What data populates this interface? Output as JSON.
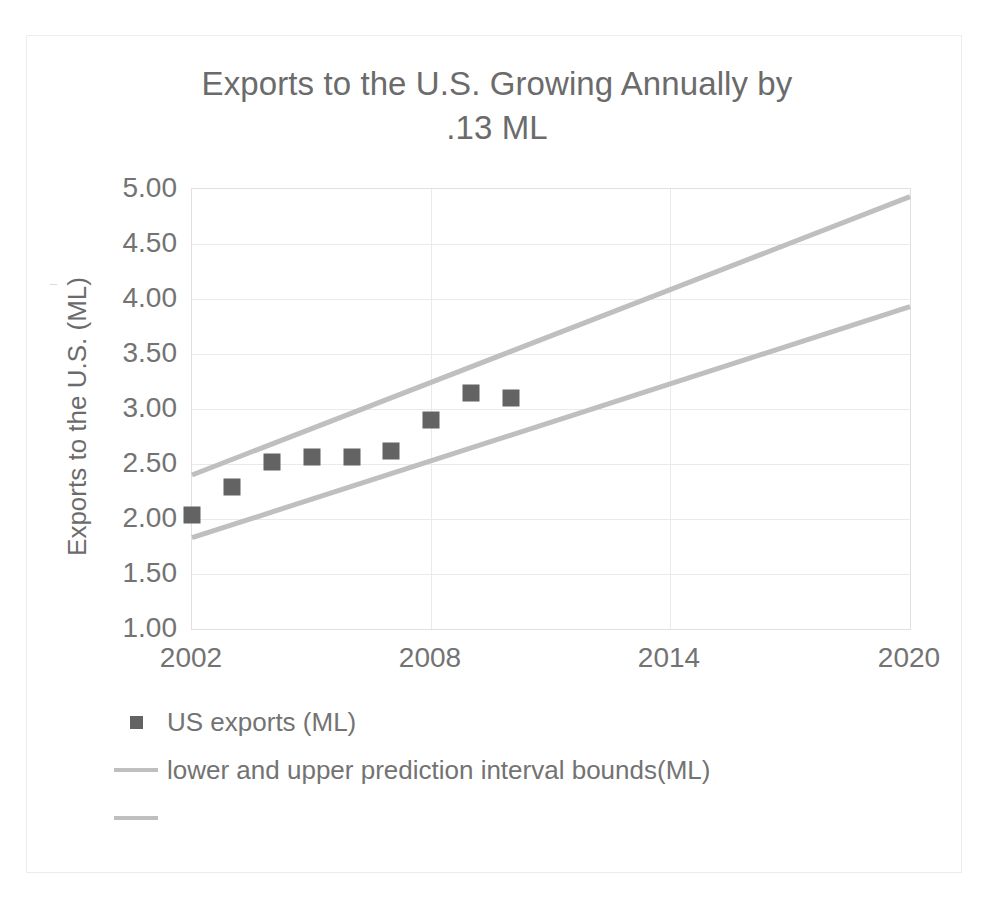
{
  "chart_data": {
    "type": "scatter",
    "title": "Exports to the U.S. Growing Annually by .13 ML",
    "title_line1": "Exports to the U.S. Growing Annually by",
    "title_line2": ".13 ML",
    "xlabel": "",
    "ylabel": "Exports to the U.S. (ML)",
    "xlim": [
      2002,
      2020
    ],
    "ylim": [
      1.0,
      5.0
    ],
    "xticks": [
      "2002",
      "2008",
      "2014",
      "2020"
    ],
    "xtick_values": [
      2002,
      2008,
      2014,
      2020
    ],
    "yticks": [
      "1.00",
      "1.50",
      "2.00",
      "2.50",
      "3.00",
      "3.50",
      "4.00",
      "4.50",
      "5.00"
    ],
    "ytick_values": [
      1.0,
      1.5,
      2.0,
      2.5,
      3.0,
      3.5,
      4.0,
      4.5,
      5.0
    ],
    "grid": "horizontal",
    "legend_position": "bottom-left",
    "series": [
      {
        "name": "US exports (ML)",
        "type": "scatter",
        "marker": "square",
        "color": "#636363",
        "x": [
          2002,
          2003,
          2004,
          2005,
          2006,
          2007,
          2008,
          2009,
          2010
        ],
        "values": [
          2.04,
          2.29,
          2.52,
          2.56,
          2.56,
          2.62,
          2.9,
          3.15,
          3.1
        ]
      },
      {
        "name": "lower and upper prediction interval bounds(ML)",
        "type": "line",
        "color": "#bfbfbf",
        "x": [
          2002,
          2020
        ],
        "values": [
          2.4,
          4.93
        ]
      },
      {
        "name": "",
        "type": "line",
        "color": "#bfbfbf",
        "x": [
          2002,
          2020
        ],
        "values": [
          1.83,
          3.93
        ]
      }
    ],
    "annotations": []
  },
  "legend": {
    "items": [
      {
        "label": "US exports (ML)",
        "swatch": "square-marker"
      },
      {
        "label": "lower and upper prediction interval bounds(ML)",
        "swatch": "line"
      },
      {
        "label": "",
        "swatch": "line"
      }
    ]
  },
  "colors": {
    "marker": "#636363",
    "bounds_line": "#bfbfbf",
    "gridline": "#eaeaea",
    "text": "#737373",
    "title_text": "#6b6b6b",
    "frame_border": "#ededed"
  }
}
